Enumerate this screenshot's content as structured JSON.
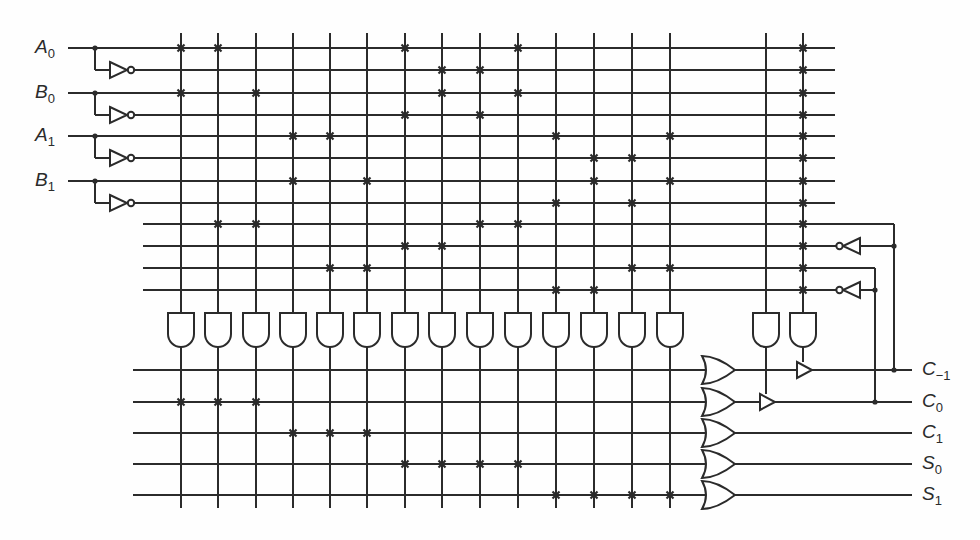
{
  "inputs": [
    {
      "name": "A",
      "sub": "0",
      "y": 48
    },
    {
      "name": "B",
      "sub": "0",
      "y": 93
    },
    {
      "name": "A",
      "sub": "1",
      "y": 136
    },
    {
      "name": "B",
      "sub": "1",
      "y": 181
    }
  ],
  "outputs": [
    {
      "name": "C",
      "sub": "−1",
      "y": 370
    },
    {
      "name": "C",
      "sub": "0",
      "y": 402
    },
    {
      "name": "C",
      "sub": "1",
      "y": 433
    },
    {
      "name": "S",
      "sub": "0",
      "y": 464
    },
    {
      "name": "S",
      "sub": "1",
      "y": 495
    }
  ],
  "and_plane": {
    "row_y": [
      48,
      70,
      93,
      115,
      136,
      158,
      181,
      203,
      224,
      246,
      268,
      290
    ],
    "col_x": [
      181,
      218,
      256,
      293,
      330,
      367,
      405,
      442,
      480,
      518,
      556,
      594,
      632,
      670,
      766,
      803
    ],
    "crosspoints": [
      [
        0,
        2
      ],
      [
        0,
        8
      ],
      [
        2,
        8
      ],
      [
        4,
        6
      ],
      [
        4,
        10
      ],
      [
        6,
        10
      ],
      [
        0,
        3,
        9
      ],
      [
        1,
        2,
        9
      ],
      [
        1,
        3,
        8
      ],
      [
        0,
        2,
        8
      ],
      [
        4,
        7,
        11
      ],
      [
        5,
        6,
        11
      ],
      [
        5,
        7,
        10
      ],
      [
        4,
        6,
        10
      ],
      [],
      [
        0,
        1,
        2,
        3,
        4,
        5,
        6,
        7,
        8,
        9,
        10,
        11
      ]
    ]
  },
  "or_plane": {
    "or_rows": [
      {
        "output": "C-1",
        "terms": []
      },
      {
        "output": "C0",
        "terms": [
          0,
          1,
          2
        ]
      },
      {
        "output": "C1",
        "terms": [
          3,
          4,
          5
        ]
      },
      {
        "output": "S0",
        "terms": [
          6,
          7,
          8,
          9
        ]
      },
      {
        "output": "S1",
        "terms": [
          10,
          11,
          12,
          13
        ]
      }
    ]
  },
  "feedback": [
    {
      "from_output": "C-1",
      "true_row": 8,
      "inverted_row": 9,
      "tap_x": 894
    },
    {
      "from_output": "C0",
      "true_row": 10,
      "inverted_row": 11,
      "tap_x": 875
    }
  ],
  "tristate_buffers": [
    {
      "on_output": "C0",
      "control_column": 14
    },
    {
      "on_output": "C-1",
      "control_column": 15
    }
  ],
  "colors": {
    "ink": "#2b2b2b",
    "background": "#fefefe"
  }
}
